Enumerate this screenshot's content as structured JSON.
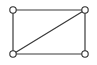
{
  "figure": {
    "name": "rectangle-graph-with-diagonal",
    "canvas": {
      "width": 97,
      "height": 65,
      "background_color": "#ffffff"
    },
    "style": {
      "edge_color": "#3a3a3a",
      "edge_width": 1.2,
      "vertex_fill_color": "#ffffff",
      "vertex_stroke_color": "#2e2e2e",
      "vertex_stroke_width": 1.1,
      "vertex_radius": 3.2
    }
  },
  "chart_data": {
    "type": "diagram",
    "title": "",
    "xlabel": "",
    "ylabel": "",
    "vertices": [
      {
        "id": "top-left",
        "label": "",
        "x": 13,
        "y": 10
      },
      {
        "id": "top-right",
        "label": "",
        "x": 85,
        "y": 10
      },
      {
        "id": "bottom-left",
        "label": "",
        "x": 13,
        "y": 54
      },
      {
        "id": "bottom-right",
        "label": "",
        "x": 85,
        "y": 54
      }
    ],
    "edges": [
      {
        "id": "edge-top",
        "from": "top-left",
        "to": "top-right",
        "kind": "side"
      },
      {
        "id": "edge-right",
        "from": "top-right",
        "to": "bottom-right",
        "kind": "side"
      },
      {
        "id": "edge-bottom",
        "from": "bottom-left",
        "to": "bottom-right",
        "kind": "side"
      },
      {
        "id": "edge-left",
        "from": "top-left",
        "to": "bottom-left",
        "kind": "side"
      },
      {
        "id": "edge-diagonal",
        "from": "bottom-left",
        "to": "top-right",
        "kind": "diagonal"
      }
    ],
    "vertex_count": 4,
    "edge_count": 5
  }
}
